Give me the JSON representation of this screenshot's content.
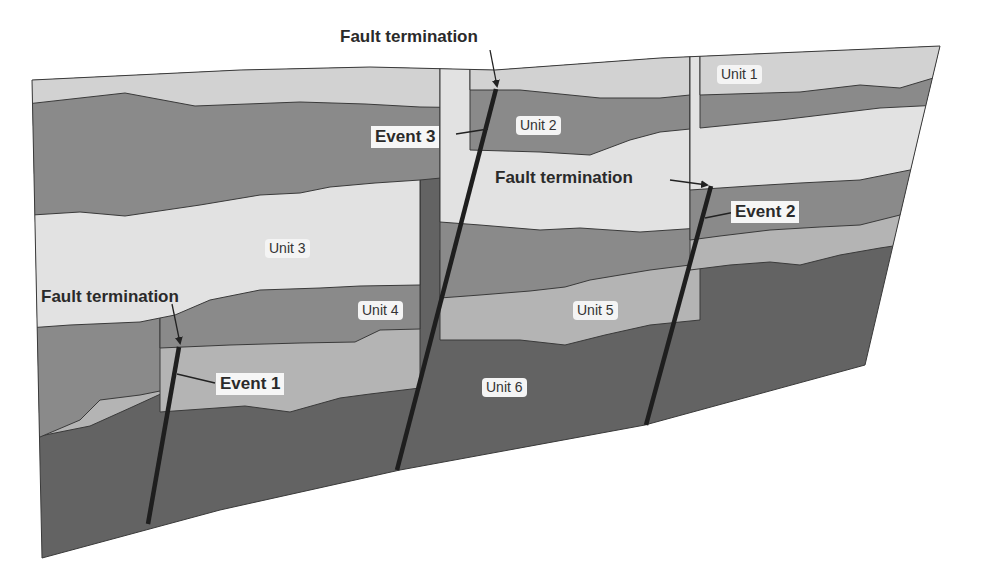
{
  "diagram": {
    "type": "geologic-cross-section",
    "colors": {
      "light_gray": "#d2d2d2",
      "very_light_gray": "#e2e2e2",
      "mid_gray": "#8a8a8a",
      "mid_light_gray": "#b4b4b4",
      "dark_gray": "#636363",
      "fault_line": "#1e1e1e"
    },
    "units": [
      {
        "id": "unit1",
        "label": "Unit 1"
      },
      {
        "id": "unit2",
        "label": "Unit 2"
      },
      {
        "id": "unit3",
        "label": "Unit 3"
      },
      {
        "id": "unit4",
        "label": "Unit 4"
      },
      {
        "id": "unit5",
        "label": "Unit 5"
      },
      {
        "id": "unit6",
        "label": "Unit 6"
      }
    ],
    "events": [
      {
        "id": "event1",
        "label": "Event 1"
      },
      {
        "id": "event2",
        "label": "Event 2"
      },
      {
        "id": "event3",
        "label": "Event 3"
      }
    ],
    "fault_terminations": [
      {
        "id": "term3",
        "label": "Fault termination"
      },
      {
        "id": "term2",
        "label": "Fault termination"
      },
      {
        "id": "term1",
        "label": "Fault termination"
      }
    ]
  }
}
